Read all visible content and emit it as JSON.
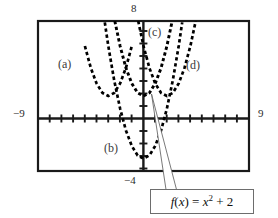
{
  "chart_data": {
    "type": "line",
    "title": "",
    "subtitle": "",
    "xlabel": "",
    "ylabel": "",
    "xlim": [
      -9,
      9
    ],
    "ylim": [
      -4,
      8
    ],
    "grid": false,
    "legend_position": "inline-annotations",
    "axis_tick_labels": {
      "top": "8",
      "left": "−9",
      "right": "9",
      "bottom": "−4"
    },
    "x_tick_step": 1,
    "y_tick_step": 1,
    "line_style": "dashed",
    "line_color": "#000000",
    "series": [
      {
        "name": "(a)",
        "label": "(a)",
        "equation": "y = (x + 3)^2 + 2",
        "vertex": [
          -3,
          2
        ],
        "points_x": [
          -6,
          -5.5,
          -5,
          -4.5,
          -4,
          -3.5,
          -3,
          -2.5,
          -2,
          -1.5,
          -1,
          -0.5,
          0
        ],
        "points_y": [
          11,
          8.25,
          6,
          4.25,
          3,
          2.25,
          2,
          2.25,
          3,
          4.25,
          6,
          8.25,
          11
        ]
      },
      {
        "name": "(b)",
        "label": "(b)",
        "equation": "y = x^2 - 3",
        "vertex": [
          0,
          -3
        ],
        "points_x": [
          -3.3,
          -3,
          -2.5,
          -2,
          -1.5,
          -1,
          -0.5,
          0,
          0.5,
          1,
          1.5,
          2,
          2.5,
          3,
          3.3
        ],
        "points_y": [
          7.89,
          6,
          3.25,
          1,
          -0.75,
          -2,
          -2.75,
          -3,
          -2.75,
          -2,
          -0.75,
          1,
          3.25,
          6,
          7.89
        ]
      },
      {
        "name": "(c)",
        "label": "(c)",
        "equation": "y = x^2 + 2",
        "vertex": [
          0,
          2
        ],
        "points_x": [
          -2.45,
          -2,
          -1.5,
          -1,
          -0.5,
          0,
          0.5,
          1,
          1.5,
          2,
          2.45
        ],
        "points_y": [
          8,
          6,
          4.25,
          3,
          2.25,
          2,
          2.25,
          3,
          4.25,
          6,
          8
        ]
      },
      {
        "name": "(d)",
        "label": "(d)",
        "equation": "y = (x - 2)^2 + 2",
        "vertex": [
          2,
          2
        ],
        "points_x": [
          -0.45,
          0,
          0.5,
          1,
          1.5,
          2,
          2.5,
          3,
          3.5,
          4,
          4.45
        ],
        "points_y": [
          8,
          6,
          4.25,
          3,
          2.25,
          2,
          2.25,
          3,
          4.25,
          6,
          8
        ]
      }
    ],
    "annotations": [
      {
        "name": "callout",
        "text": "f(x) = x² + 2",
        "points_to_series": "(c)",
        "points_to": [
          0.6,
          2.4
        ]
      }
    ]
  },
  "labels": {
    "top": "8",
    "left": "−9",
    "right": "9",
    "bottom": "−4",
    "curve_a": "(a)",
    "curve_b": "(b)",
    "curve_c": "(c)",
    "curve_d": "(d)"
  },
  "formula": {
    "full": "f(x) = x² + 2",
    "fn_name": "f",
    "variable": "x",
    "body": "x",
    "exponent": "2",
    "constant": "2",
    "equals": "=",
    "plus": "+"
  },
  "colors": {
    "curve": "#000000",
    "frame": "#1a1a1a",
    "axis": "#1a1a1a",
    "callout": "#4a4a4a",
    "box_border": "#6d6d6d",
    "label_text": "#3a3a3a",
    "background": "#ffffff"
  }
}
